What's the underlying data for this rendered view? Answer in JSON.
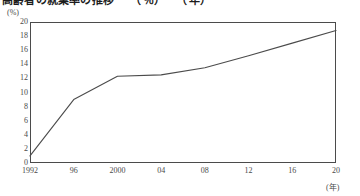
{
  "figure": {
    "title": "高齢者の就業率の推移　　（％）　　（年）",
    "title_clipped": true
  },
  "axes": {
    "y_unit": "(%)",
    "x_unit": "(年)",
    "y_ticks": [
      "20",
      "18",
      "16",
      "14",
      "12",
      "10",
      "8",
      "6",
      "4",
      "2",
      "0"
    ],
    "x_ticks": [
      "1992",
      "96",
      "2000",
      "04",
      "08",
      "12",
      "16",
      "20"
    ]
  },
  "chart_data": {
    "type": "line",
    "title": "高齢者の就業率の推移",
    "xlabel": "(年)",
    "ylabel": "(%)",
    "ylim": [
      0,
      20
    ],
    "xlim": [
      1992,
      2020
    ],
    "ytick_step": 2,
    "grid": false,
    "legend": "none",
    "line_color": "#4b4b4b",
    "x": [
      1992,
      1996,
      2000,
      2004,
      2008,
      2012,
      2016,
      2020
    ],
    "values": [
      1.0,
      9.0,
      12.3,
      12.5,
      13.5,
      15.2,
      17.0,
      18.8
    ],
    "series": [
      {
        "name": "就業率",
        "x": [
          1992,
          1996,
          2000,
          2004,
          2008,
          2012,
          2016,
          2020
        ],
        "values": [
          1.0,
          9.0,
          12.3,
          12.5,
          13.5,
          15.2,
          17.0,
          18.8
        ]
      }
    ]
  }
}
